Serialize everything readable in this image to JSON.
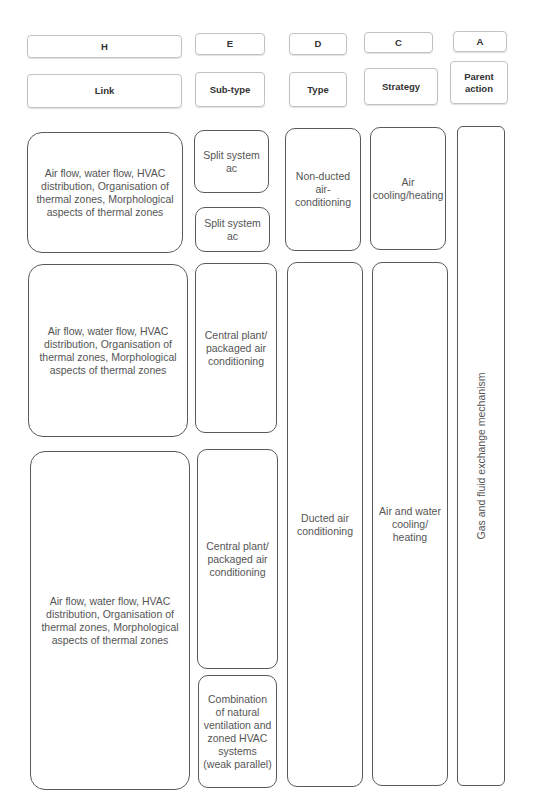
{
  "headers": [
    {
      "letter": "H",
      "label": "Link"
    },
    {
      "letter": "E",
      "label": "Sub-type"
    },
    {
      "letter": "D",
      "label": "Type"
    },
    {
      "letter": "C",
      "label": "Strategy"
    },
    {
      "letter": "A",
      "label": "Parent\naction"
    }
  ],
  "columns": {
    "H": {
      "items": [
        {
          "text": "Air flow, water flow, HVAC\ndistribution, Organisation of\nthermal zones, Morphological\naspects of thermal zones"
        },
        {
          "text": "Air flow, water flow, HVAC\ndistribution, Organisation of\nthermal zones, Morphological\naspects of thermal zones"
        },
        {
          "text": "Air flow, water flow, HVAC\ndistribution, Organisation of\nthermal zones, Morphological\naspects of thermal zones"
        }
      ]
    },
    "E": {
      "items": [
        {
          "text": "Split system\nac"
        },
        {
          "text": "Split system\nac"
        },
        {
          "text": "Central plant/\npackaged air\nconditioning"
        },
        {
          "text": "Central plant/\npackaged air\nconditioning"
        },
        {
          "text": "Combination\nof natural\nventilation and\nzoned HVAC\nsystems\n(weak parallel)"
        }
      ]
    },
    "D": {
      "items": [
        {
          "text": "Non-ducted\nair-\nconditioning"
        },
        {
          "text": "Ducted air\nconditioning"
        }
      ]
    },
    "C": {
      "items": [
        {
          "text": "Air\ncooling/heating"
        },
        {
          "text": "Air and water\ncooling/\nheating"
        }
      ]
    },
    "A": {
      "items": [
        {
          "text": "Gas and fluid exchange mechanism"
        }
      ]
    }
  }
}
